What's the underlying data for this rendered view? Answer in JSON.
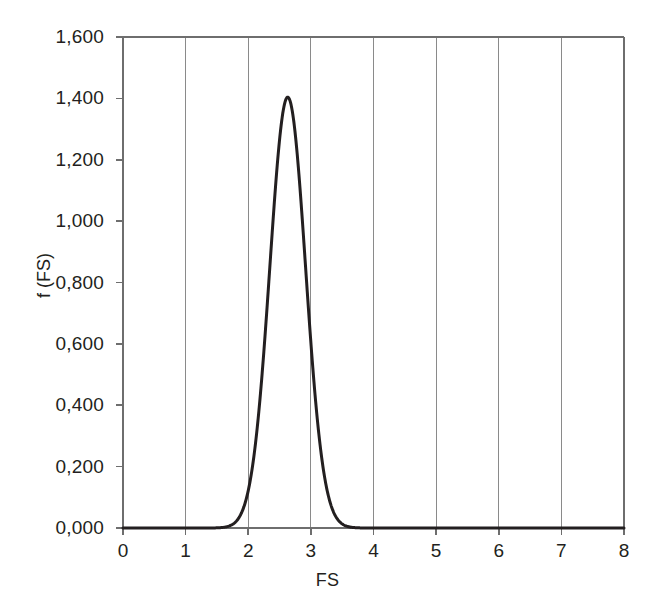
{
  "chart_data": {
    "type": "line",
    "title": "",
    "subtitle": "",
    "xlabel": "FS",
    "ylabel": "f (FS)",
    "xlim": [
      0,
      8
    ],
    "ylim": [
      0.0,
      1.6
    ],
    "grid": "vertical-only",
    "legend": "none",
    "x_tick_labels": [
      "0",
      "1",
      "2",
      "3",
      "4",
      "5",
      "6",
      "7",
      "8"
    ],
    "x_tick_values": [
      0,
      1,
      2,
      3,
      4,
      5,
      6,
      7,
      8
    ],
    "y_tick_labels": [
      "0,000",
      "0,200",
      "0,400",
      "0,600",
      "0,800",
      "1,000",
      "1,200",
      "1,400",
      "1,600"
    ],
    "y_tick_values": [
      0.0,
      0.2,
      0.4,
      0.6,
      0.8,
      1.0,
      1.2,
      1.4,
      1.6
    ],
    "decimal_separator": ",",
    "series": [
      {
        "name": "f (FS)",
        "color": "#231f20",
        "line_width": 3,
        "distribution": "normal",
        "mean": 2.63,
        "std_dev": 0.285,
        "peak_value": 1.404,
        "peak_x": 2.63,
        "x": [
          0.0,
          0.2,
          0.4,
          0.6,
          0.8,
          1.0,
          1.2,
          1.4,
          1.5,
          1.6,
          1.7,
          1.75,
          1.8,
          1.85,
          1.9,
          1.95,
          2.0,
          2.05,
          2.1,
          2.15,
          2.2,
          2.25,
          2.3,
          2.35,
          2.4,
          2.45,
          2.5,
          2.55,
          2.6,
          2.63,
          2.65,
          2.7,
          2.75,
          2.8,
          2.85,
          2.9,
          2.95,
          3.0,
          3.05,
          3.1,
          3.15,
          3.2,
          3.25,
          3.3,
          3.35,
          3.4,
          3.45,
          3.5,
          3.6,
          3.8,
          4.0,
          4.5,
          5.0,
          5.5,
          6.0,
          6.5,
          7.0,
          7.5,
          8.0
        ],
        "y": [
          0.0,
          0.0,
          0.0,
          0.0,
          0.0,
          0.0,
          0.0,
          0.001,
          0.003,
          0.008,
          0.019,
          0.029,
          0.043,
          0.062,
          0.088,
          0.122,
          0.166,
          0.221,
          0.288,
          0.367,
          0.457,
          0.557,
          0.664,
          0.774,
          0.883,
          0.985,
          1.077,
          1.153,
          1.21,
          1.404,
          1.245,
          1.258,
          1.247,
          1.213,
          1.157,
          1.082,
          0.992,
          0.892,
          0.787,
          0.681,
          0.578,
          0.482,
          0.395,
          0.317,
          0.25,
          0.193,
          0.146,
          0.109,
          0.058,
          0.014,
          0.002,
          0.0,
          0.0,
          0.0,
          0.0,
          0.0,
          0.0,
          0.0,
          0.0
        ]
      }
    ],
    "axis_color": "#6e6e6e",
    "gridline_color": "#8a8a8a",
    "background_color": "#ffffff"
  },
  "axes": {
    "x_title": "FS",
    "y_title": "f (FS)"
  },
  "y_ticks": [
    {
      "label": "1,600",
      "value": 1.6
    },
    {
      "label": "1,400",
      "value": 1.4
    },
    {
      "label": "1,200",
      "value": 1.2
    },
    {
      "label": "1,000",
      "value": 1.0
    },
    {
      "label": "0,800",
      "value": 0.8
    },
    {
      "label": "0,600",
      "value": 0.6
    },
    {
      "label": "0,400",
      "value": 0.4
    },
    {
      "label": "0,200",
      "value": 0.2
    },
    {
      "label": "0,000",
      "value": 0.0
    }
  ],
  "x_ticks": [
    {
      "label": "0",
      "value": 0
    },
    {
      "label": "1",
      "value": 1
    },
    {
      "label": "2",
      "value": 2
    },
    {
      "label": "3",
      "value": 3
    },
    {
      "label": "4",
      "value": 4
    },
    {
      "label": "5",
      "value": 5
    },
    {
      "label": "6",
      "value": 6
    },
    {
      "label": "7",
      "value": 7
    },
    {
      "label": "8",
      "value": 8
    }
  ]
}
